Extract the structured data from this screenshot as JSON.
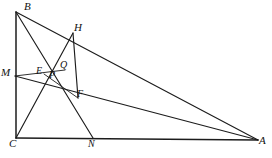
{
  "figure": {
    "kind": "euclidean-geometry-diagram",
    "background_color": "#ffffff",
    "line_color": "#1c1c1c",
    "label_color": "#111111",
    "width": 272,
    "height": 158
  },
  "points": [
    {
      "id": "B",
      "label": "B",
      "x": 16,
      "y": 12,
      "label_x": 24,
      "label_y": 1,
      "role": "triangle-vertex"
    },
    {
      "id": "H",
      "label": "H",
      "x": 73,
      "y": 33,
      "label_x": 74,
      "label_y": 22,
      "role": "point-on-BA"
    },
    {
      "id": "M",
      "label": "M",
      "x": 15,
      "y": 76,
      "label_x": 1,
      "label_y": 67,
      "role": "point-on-BC"
    },
    {
      "id": "E",
      "label": "E",
      "x": 44,
      "y": 74,
      "label_x": 36,
      "label_y": 66,
      "role": "intersection"
    },
    {
      "id": "P",
      "label": "P",
      "x": 55,
      "y": 78,
      "label_x": 49,
      "label_y": 70,
      "role": "intersection"
    },
    {
      "id": "Q",
      "label": "Q",
      "x": 65,
      "y": 70,
      "label_x": 60,
      "label_y": 60,
      "role": "intersection"
    },
    {
      "id": "F",
      "label": "F",
      "x": 78,
      "y": 98,
      "label_x": 77,
      "label_y": 89,
      "role": "intersection"
    },
    {
      "id": "C",
      "label": "C",
      "x": 16,
      "y": 138,
      "label_x": 9,
      "label_y": 138,
      "role": "triangle-vertex"
    },
    {
      "id": "N",
      "label": "N",
      "x": 93,
      "y": 138,
      "label_x": 88,
      "label_y": 139,
      "role": "point-on-CA"
    },
    {
      "id": "A",
      "label": "A",
      "x": 258,
      "y": 140,
      "label_x": 259,
      "label_y": 135,
      "role": "triangle-vertex"
    }
  ],
  "segments": [
    {
      "id": "BC",
      "from": "B",
      "to": "C",
      "weight": "thick",
      "desc": "left leg of right triangle"
    },
    {
      "id": "CA",
      "from": "C",
      "to": "A",
      "weight": "thick",
      "desc": "base of right triangle"
    },
    {
      "id": "BA",
      "from": "B",
      "to": "A",
      "weight": "med",
      "desc": "hypotenuse through H"
    },
    {
      "id": "BN",
      "from": "B",
      "to": "N",
      "weight": "med",
      "desc": "cevian from B to N through Q and F"
    },
    {
      "id": "CH",
      "from": "C",
      "to": "H",
      "weight": "med",
      "desc": "cevian from C to H through P and Q"
    },
    {
      "id": "MA",
      "from": "M",
      "to": "A",
      "weight": "med",
      "desc": "line from M on BC to A through E and P"
    },
    {
      "id": "HF",
      "from": "H",
      "to": "F",
      "weight": "med",
      "desc": "segment from H down to F"
    },
    {
      "id": "EF",
      "from": "E",
      "to": "F",
      "weight": "thin",
      "desc": "short segment E to F"
    },
    {
      "id": "MQ",
      "from": "M",
      "to": "Q",
      "weight": "thin",
      "desc": "segment from M up-right to Q"
    }
  ],
  "labels_note": "All point labels are italic serif capitals."
}
